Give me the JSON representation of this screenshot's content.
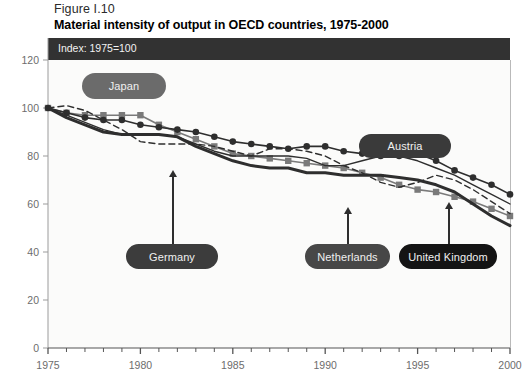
{
  "figure": {
    "number": "Figure I.10",
    "title": "Material intensity of output in OECD countries, 1975-2000",
    "banner_note": "Index: 1975=100"
  },
  "colors": {
    "banner_bg": "#323232",
    "plot_bg": "#fbfbfa",
    "axis": "#9b9b9b",
    "tick_text": "#6d6d6d",
    "japan": "#6b6b6b",
    "austria": "#3a3a3a",
    "germany": "#3c3c3c",
    "netherlands": "#474747",
    "united_kingdom": "#141414",
    "series_dark": "#2e2e2e",
    "series_gray": "#7a7a7a"
  },
  "callouts": [
    {
      "id": "japan",
      "label": "Japan",
      "pill_color": "#6b6b6b"
    },
    {
      "id": "austria",
      "label": "Austria",
      "pill_color": "#3a3a3a"
    },
    {
      "id": "germany",
      "label": "Germany",
      "pill_color": "#3c3c3c"
    },
    {
      "id": "netherlands",
      "label": "Netherlands",
      "pill_color": "#474747"
    },
    {
      "id": "united_kingdom",
      "label": "United Kingdom",
      "pill_color": "#141414"
    }
  ],
  "chart_data": {
    "type": "line",
    "title": "Material intensity of output in OECD countries, 1975-2000",
    "subtitle": "Index: 1975=100",
    "xlabel": "",
    "ylabel": "",
    "xlim": [
      1975,
      2000
    ],
    "ylim": [
      0,
      120
    ],
    "xticks": [
      1975,
      1980,
      1985,
      1990,
      1995,
      2000
    ],
    "xtick_labels": [
      "1975",
      "1980",
      "1985",
      "1990",
      "1995",
      "2000"
    ],
    "yticks": [
      0,
      20,
      40,
      60,
      80,
      100,
      120
    ],
    "ytick_labels": [
      "0",
      "20",
      "40",
      "60",
      "80",
      "100",
      "120"
    ],
    "minor_xticks_per_interval": 5,
    "grid": false,
    "legend_position": "inline-callouts",
    "x": [
      1975,
      1976,
      1977,
      1978,
      1979,
      1980,
      1981,
      1982,
      1983,
      1984,
      1985,
      1986,
      1987,
      1988,
      1989,
      1990,
      1991,
      1992,
      1993,
      1994,
      1995,
      1996,
      1997,
      1998,
      1999,
      2000
    ],
    "series": [
      {
        "name": "Japan",
        "marker": "square",
        "color": "#7a7a7a",
        "linestyle": "solid",
        "linewidth": 1.6,
        "values": [
          100,
          98,
          97,
          97,
          97,
          97,
          93,
          90,
          87,
          84,
          81,
          80,
          79,
          78,
          77,
          76,
          75,
          73,
          71,
          68,
          66,
          65,
          63,
          61,
          58,
          55
        ]
      },
      {
        "name": "Austria",
        "marker": "circle",
        "color": "#2e2e2e",
        "linestyle": "solid",
        "linewidth": 1.6,
        "values": [
          100,
          98,
          96,
          95,
          95,
          93,
          92,
          91,
          90,
          88,
          86,
          85,
          84,
          83,
          84,
          84,
          82,
          81,
          80,
          80,
          81,
          78,
          74,
          71,
          68,
          64
        ]
      },
      {
        "name": "Germany",
        "marker": "none",
        "color": "#2e2e2e",
        "linestyle": "solid",
        "linewidth": 3.0,
        "values": [
          100,
          96,
          93,
          90,
          89,
          89,
          89,
          88,
          84,
          81,
          78,
          76,
          75,
          75,
          73,
          73,
          72,
          72,
          72,
          71,
          70,
          68,
          65,
          60,
          55,
          51
        ]
      },
      {
        "name": "Netherlands",
        "marker": "none",
        "color": "#2e2e2e",
        "linestyle": "dashed",
        "linewidth": 1.4,
        "values": [
          100,
          101,
          99,
          95,
          91,
          86,
          85,
          85,
          85,
          84,
          82,
          80,
          83,
          83,
          82,
          80,
          76,
          73,
          69,
          67,
          69,
          72,
          70,
          66,
          61,
          56
        ]
      },
      {
        "name": "United Kingdom",
        "marker": "none",
        "color": "#2e2e2e",
        "linestyle": "solid",
        "linewidth": 1.4,
        "values": [
          100,
          97,
          94,
          91,
          89,
          89,
          89,
          88,
          85,
          82,
          80,
          80,
          80,
          80,
          79,
          76,
          76,
          78,
          80,
          80,
          78,
          75,
          72,
          68,
          64,
          60
        ]
      }
    ]
  },
  "axis_geometry": {
    "plot_left": 48,
    "plot_right": 510,
    "plot_top": 60,
    "plot_bottom": 348
  }
}
